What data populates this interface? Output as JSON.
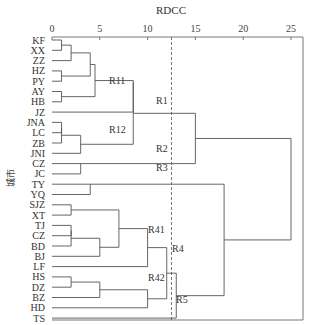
{
  "chart_data": {
    "type": "dendrogram",
    "title": "RDCC",
    "xlabel": "RDCC",
    "ylabel": "城市",
    "xlim": [
      0,
      25
    ],
    "x_ticks": [
      0,
      5,
      10,
      15,
      20,
      25
    ],
    "cut_line_x": 12.5,
    "leaves": [
      "KF",
      "XX",
      "ZZ",
      "HZ",
      "PY",
      "AY",
      "HB",
      "JZ",
      "JNA",
      "LC",
      "ZB",
      "JNI",
      "CZ",
      "JC",
      "TY",
      "YQ",
      "SJZ",
      "XT",
      "TJ",
      "CZ",
      "BD",
      "BJ",
      "LF",
      "HS",
      "DZ",
      "BZ",
      "HD",
      "TS"
    ],
    "merges": [
      {
        "a": "KF",
        "b": "XX",
        "height": 1
      },
      {
        "a": "(KF,XX)",
        "b": "ZZ",
        "height": 2
      },
      {
        "a": "HZ",
        "b": "PY",
        "height": 1
      },
      {
        "a": "(KF,XX,ZZ)",
        "b": "(HZ,PY)",
        "height": 4
      },
      {
        "a": "AY",
        "b": "HB",
        "height": 1
      },
      {
        "a": "(KF..PY)",
        "b": "(AY,HB)",
        "height": 4.5
      },
      {
        "a": "(KF..HB)",
        "b": "JZ",
        "height": 5
      },
      {
        "a": "JNA",
        "b": "LC",
        "height": 1
      },
      {
        "a": "(JNA,LC)",
        "b": "ZB",
        "height": 1
      },
      {
        "a": "(JNA,LC,ZB)",
        "b": "JNI",
        "height": 3
      },
      {
        "a": "R11",
        "b": "R12",
        "height": 8.5,
        "label": "R1"
      },
      {
        "a": "CZ",
        "b": "JC",
        "height": 3
      },
      {
        "a": "R1",
        "b": "R2",
        "height": 15
      },
      {
        "a": "TY",
        "b": "YQ",
        "height": 4
      },
      {
        "a": "SJZ",
        "b": "XT",
        "height": 2
      },
      {
        "a": "TJ",
        "b": "CZ",
        "height": 2
      },
      {
        "a": "(TJ,CZ)",
        "b": "BD",
        "height": 2
      },
      {
        "a": "(TJ,CZ,BD)",
        "b": "BJ",
        "height": 5
      },
      {
        "a": "(SJZ,XT)",
        "b": "(TJ..BJ)",
        "height": 7
      },
      {
        "a": "(SJZ..BJ)",
        "b": "LF",
        "height": 10
      },
      {
        "a": "HS",
        "b": "DZ",
        "height": 2
      },
      {
        "a": "(HS,DZ)",
        "b": "BZ",
        "height": 5
      },
      {
        "a": "(HS,DZ,BZ)",
        "b": "HD",
        "height": 10
      },
      {
        "a": "R41",
        "b": "R42",
        "height": 12
      },
      {
        "a": "R4",
        "b": "TS",
        "height": 13
      },
      {
        "a": "R3",
        "b": "(R4,R5)",
        "height": 18
      },
      {
        "a": "(R1,R2)",
        "b": "(R3,R4,R5)",
        "height": 25
      }
    ],
    "cluster_labels": [
      "R11",
      "R12",
      "R1",
      "R2",
      "R3",
      "R41",
      "R42",
      "R4",
      "R5"
    ],
    "grid": false,
    "legend": "none"
  }
}
